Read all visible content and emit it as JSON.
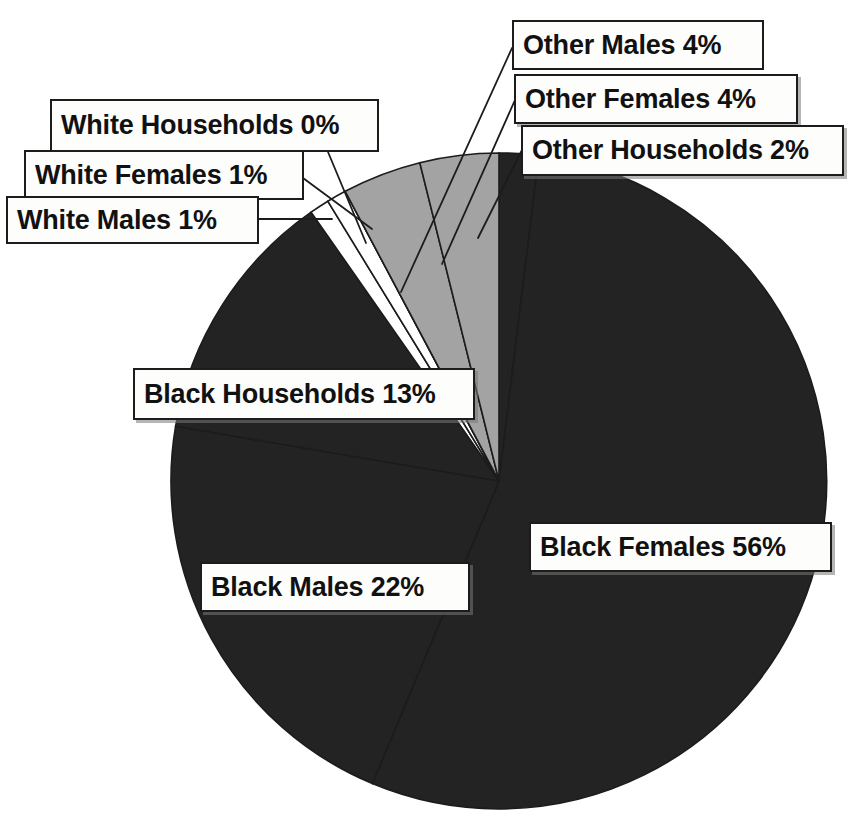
{
  "chart_data": {
    "type": "pie",
    "title": "",
    "subtitle": "",
    "xlabel": "",
    "ylabel": "",
    "grid": false,
    "legend_position": "none",
    "labels_as_callouts": true,
    "categories": [
      "Other Households",
      "Other Males",
      "Other Females",
      "White Households",
      "White Females",
      "White Males",
      "Black Households",
      "Black Males",
      "Black Females"
    ],
    "values": [
      2,
      4,
      4,
      0,
      1,
      1,
      13,
      22,
      56
    ],
    "value_unit": "%",
    "slices": [
      {
        "label": "Other Households",
        "value": 2,
        "percent_text": "2%",
        "color": "#232323",
        "order_clockwise_from_12": 1
      },
      {
        "label": "Black Females",
        "value": 56,
        "percent_text": "56%",
        "color": "#232323",
        "order_clockwise_from_12": 2
      },
      {
        "label": "Black Males",
        "value": 22,
        "percent_text": "22%",
        "color": "#232323",
        "order_clockwise_from_12": 3
      },
      {
        "label": "Black Households",
        "value": 13,
        "percent_text": "13%",
        "color": "#232323",
        "order_clockwise_from_12": 4
      },
      {
        "label": "White Males",
        "value": 1,
        "percent_text": "1%",
        "color": "#ffffff",
        "order_clockwise_from_12": 5
      },
      {
        "label": "White Females",
        "value": 1,
        "percent_text": "1%",
        "color": "#ffffff",
        "order_clockwise_from_12": 6
      },
      {
        "label": "White Households",
        "value": 0,
        "percent_text": "0%",
        "color": "#ffffff",
        "order_clockwise_from_12": 7
      },
      {
        "label": "Other Females",
        "value": 4,
        "percent_text": "4%",
        "color": "#a3a3a3",
        "order_clockwise_from_12": 8
      },
      {
        "label": "Other Males",
        "value": 4,
        "percent_text": "4%",
        "color": "#a3a3a3",
        "order_clockwise_from_12": 9
      }
    ],
    "colors": {
      "dark_slice": "#232323",
      "gray_slice": "#a3a3a3",
      "white_slice": "#ffffff",
      "outline": "#1c1c1c",
      "background": "#ffffff",
      "callout_fill": "#fdfdfb",
      "callout_border": "#1c1c1c",
      "text": "#111111"
    }
  },
  "callouts": {
    "white_households": "White Households 0%",
    "white_females": "White Females 1%",
    "white_males": "White Males 1%",
    "other_males": "Other Males 4%",
    "other_females": "Other Females 4%",
    "other_households": "Other Households 2%",
    "black_households": "Black Households 13%",
    "black_females": "Black Females 56%",
    "black_males": "Black Males 22%"
  }
}
